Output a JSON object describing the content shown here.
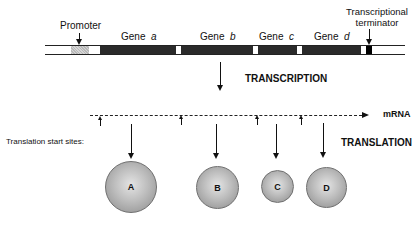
{
  "labels": {
    "promoter": "Promoter",
    "terminator_line1": "Transcriptional",
    "terminator_line2": "terminator",
    "gene_prefix": "Gene",
    "genes": [
      "a",
      "b",
      "c",
      "d"
    ],
    "transcription": "TRANSCRIPTION",
    "translation": "TRANSLATION",
    "mrna": "mRNA",
    "start_sites": "Translation start  sites:"
  },
  "proteins": [
    "A",
    "B",
    "C",
    "D"
  ],
  "colors": {
    "gene": "#2a2a2a",
    "terminator": "#000000",
    "promoter": "#c8c8c8",
    "protein": "#aaaaaa"
  }
}
